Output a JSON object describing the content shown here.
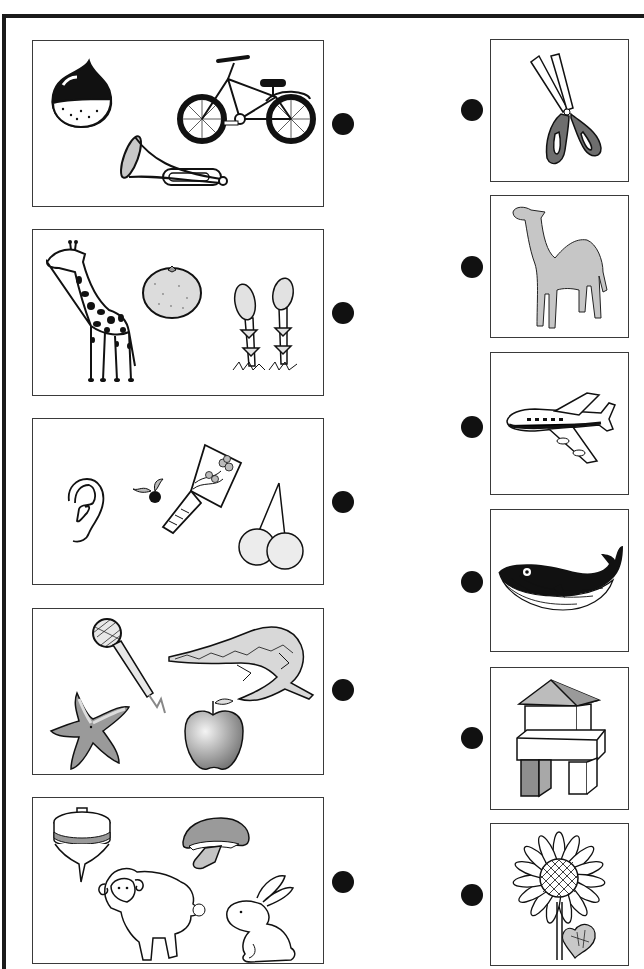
{
  "worksheet": {
    "type": "matching-lines",
    "left_groups": [
      {
        "items": [
          "chestnut",
          "bicycle",
          "trumpet"
        ]
      },
      {
        "items": [
          "giraffe",
          "mandarin orange",
          "asparagus"
        ]
      },
      {
        "items": [
          "ear",
          "blueberry",
          "battledore (hagoita)",
          "cherries"
        ]
      },
      {
        "items": [
          "microphone",
          "crocodile",
          "starfish",
          "apple"
        ]
      },
      {
        "items": [
          "spinning top",
          "mushroom",
          "sheep",
          "rabbit"
        ]
      }
    ],
    "right_items": [
      {
        "item": "scissors"
      },
      {
        "item": "camel"
      },
      {
        "item": "airplane"
      },
      {
        "item": "whale"
      },
      {
        "item": "building blocks"
      },
      {
        "item": "sunflower"
      }
    ],
    "colors": {
      "frame": "#1a1a1a",
      "box_border": "#3a3a3a",
      "dot": "#111111",
      "gray_fill": "#9a9a9a",
      "light_gray": "#d4d4d4"
    }
  }
}
